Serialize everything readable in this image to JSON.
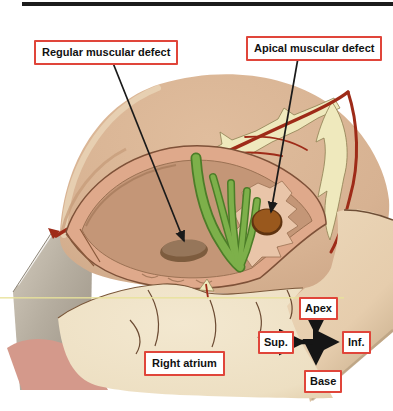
{
  "figure": {
    "type": "anatomical-illustration"
  },
  "labels": {
    "regular_defect": "Regular muscular defect",
    "apical_defect": "Apical muscular defect",
    "right_atrium": "Right atrium",
    "apex": "Apex",
    "sup": "Sup.",
    "inf": "Inf.",
    "base": "Base"
  },
  "colors": {
    "label_border": "#e0453a",
    "label_text": "#111111",
    "leader_line": "#1a1a1a",
    "compass_black": "#151515",
    "top_bar": "#1c1c1c",
    "heart_tan": "#d7b292",
    "heart_tan_light": "#e9d4b6",
    "fat_yellow": "#efe9bd",
    "fat_outline": "#8d7f52",
    "artery_red": "#9e2b18",
    "cavity_rim_salmon": "#dfa98b",
    "cavity_outline": "#7e5138",
    "cavity_inner": "#c49677",
    "trabecular_pocket": "#e9c5a9",
    "chordae_green": "#7db04a",
    "chordae_green_dark": "#4c7d28",
    "apical_defect_brown": "#99581d",
    "regular_defect_brown": "#96765a",
    "retractor_gray": "#b6aea0",
    "retractor_gray_dark": "#9a9184",
    "muscle_pink": "#d4998b",
    "atrium_cream": "#f3e8d0",
    "atrium_shade": "#e0cba8",
    "atrium_line": "#6b4a32",
    "side_tan": "#e6cdad",
    "scan_line_yellow": "#e8e29b"
  }
}
